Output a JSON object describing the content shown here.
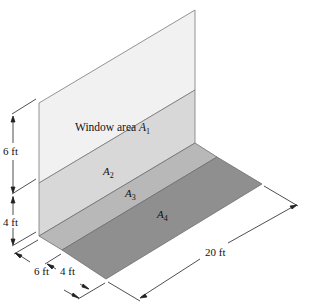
{
  "diagram": {
    "labels": {
      "a1": {
        "text": "Window area",
        "var": "A",
        "sub": "1"
      },
      "a2": {
        "var": "A",
        "sub": "2"
      },
      "a3": {
        "var": "A",
        "sub": "3"
      },
      "a4": {
        "var": "A",
        "sub": "4"
      }
    },
    "dimensions": {
      "window_height": "6 ft",
      "wall_lower_height": "4 ft",
      "floor_depth_near": "6 ft",
      "floor_depth_far": "4 ft",
      "length": "20 ft"
    },
    "colors": {
      "a1": "#f1f1f1",
      "a2": "#d9d9d9",
      "a3": "#b9b9b9",
      "a4": "#8e8e8e",
      "edge": "#6e6e6e",
      "dim_line": "#222222"
    }
  }
}
